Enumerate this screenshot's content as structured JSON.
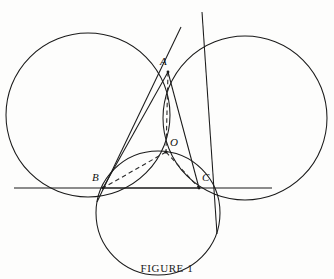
{
  "figure": {
    "caption": "FIGURE 1",
    "background_color": "#fdfdfc",
    "stroke_color": "#1a1a1a",
    "dash_color": "#2a2a2a",
    "labels": {
      "A": "A",
      "B": "B",
      "C": "C",
      "O": "O"
    }
  },
  "chart_data": {
    "type": "diagram",
    "title": "FIGURE 1",
    "coordinate_space": {
      "width": 334,
      "height": 279
    },
    "points": [
      {
        "name": "A",
        "x": 168,
        "y": 72,
        "label": "A",
        "label_dx": -8,
        "label_dy": -11
      },
      {
        "name": "B",
        "x": 103,
        "y": 188,
        "label": "B",
        "label_dx": -11,
        "label_dy": -12
      },
      {
        "name": "C",
        "x": 199,
        "y": 188,
        "label": "C",
        "label_dx": 3,
        "label_dy": -12
      },
      {
        "name": "O",
        "x": 166,
        "y": 152,
        "label": "O",
        "label_dx": 4,
        "label_dy": -12
      }
    ],
    "circles": [
      {
        "name": "circle-left-AOB",
        "cx": 88,
        "cy": 115,
        "r": 82,
        "through": [
          "A",
          "O",
          "B"
        ]
      },
      {
        "name": "circle-right-AOC",
        "cx": 245,
        "cy": 118,
        "r": 82,
        "through": [
          "A",
          "O",
          "C"
        ]
      },
      {
        "name": "circle-bottom-BOC",
        "cx": 158,
        "cy": 213,
        "r": 62,
        "through": [
          "B",
          "O",
          "C"
        ]
      }
    ],
    "lines": [
      {
        "name": "line-horizontal-BC",
        "x1": 14,
        "y1": 188,
        "x2": 272,
        "y2": 188,
        "style": "solid"
      },
      {
        "name": "line-tangent-through-A-and-C",
        "x1": 202,
        "y1": 12,
        "x2": 217,
        "y2": 234,
        "style": "solid"
      },
      {
        "name": "line-tangent-through-A-and-B",
        "x1": 181,
        "y1": 27,
        "x2": 97,
        "y2": 202,
        "style": "solid"
      },
      {
        "name": "segment-A-O",
        "x1": 168,
        "y1": 72,
        "x2": 166,
        "y2": 152,
        "style": "dashed"
      },
      {
        "name": "segment-O-B",
        "x1": 166,
        "y1": 152,
        "x2": 103,
        "y2": 188,
        "style": "dashed"
      },
      {
        "name": "segment-O-C",
        "x1": 166,
        "y1": 152,
        "x2": 199,
        "y2": 188,
        "style": "dashed"
      },
      {
        "name": "segment-A-B",
        "x1": 168,
        "y1": 72,
        "x2": 103,
        "y2": 188,
        "style": "solid"
      },
      {
        "name": "segment-A-C",
        "x1": 168,
        "y1": 72,
        "x2": 199,
        "y2": 188,
        "style": "solid"
      },
      {
        "name": "segment-B-C",
        "x1": 103,
        "y1": 188,
        "x2": 199,
        "y2": 188,
        "style": "solid"
      }
    ]
  }
}
